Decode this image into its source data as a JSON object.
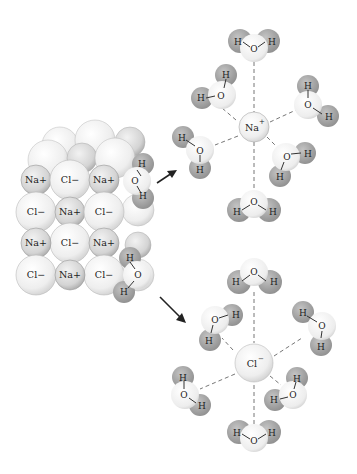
{
  "diagram": {
    "crystal": {
      "rows": [
        [
          "Na+",
          "Cl−",
          "Na+"
        ],
        [
          "Cl−",
          "Na+",
          "Cl−"
        ],
        [
          "Na+",
          "Cl−",
          "Na+"
        ],
        [
          "Cl−",
          "Na+",
          "Cl−"
        ]
      ]
    },
    "hydrated_cation": {
      "ion": "Na",
      "charge": "+",
      "water_count": 6
    },
    "hydrated_anion": {
      "ion": "Cl",
      "charge": "−",
      "water_count": 6
    },
    "water_atoms": {
      "oxygen": "O",
      "hydrogen": "H"
    },
    "colors": {
      "cl_ion": "#f2f2f2",
      "na_ion": "#d9d9d9",
      "hydrogen": "#a9a9a9",
      "oxygen": "#f4f4f4",
      "line": "#333333"
    }
  }
}
